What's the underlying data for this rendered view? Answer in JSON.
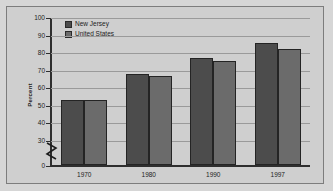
{
  "chart_data": {
    "type": "bar",
    "title": "",
    "xlabel": "",
    "ylabel": "Percent",
    "categories": [
      "1970",
      "1980",
      "1990",
      "1997"
    ],
    "series": [
      {
        "name": "New Jersey",
        "color": "#4c4c4c",
        "values": [
          52.5,
          67.5,
          76.5,
          85.0
        ]
      },
      {
        "name": "United States",
        "color": "#6b6b6b",
        "values": [
          52.5,
          66.5,
          75.0,
          82.0
        ]
      }
    ],
    "ylim": [
      0,
      100
    ],
    "yticks": [
      "0",
      "30",
      "40",
      "50",
      "60",
      "70",
      "80",
      "90",
      "100"
    ],
    "grid": true,
    "legend_position": "top-left",
    "axis_break": true,
    "axis_break_note": "y-axis broken between 0 and 30"
  },
  "legend": {
    "entries": [
      {
        "label": "New Jersey"
      },
      {
        "label": "United States"
      }
    ]
  },
  "axes": {
    "y_title": "Percent",
    "y_ticks": [
      {
        "label": "100",
        "value": 100
      },
      {
        "label": "90",
        "value": 90
      },
      {
        "label": "80",
        "value": 80
      },
      {
        "label": "70",
        "value": 70
      },
      {
        "label": "60",
        "value": 60
      },
      {
        "label": "50",
        "value": 50
      },
      {
        "label": "40",
        "value": 40
      },
      {
        "label": "30",
        "value": 30
      },
      {
        "label": "0",
        "value": 0
      }
    ],
    "x_categories": [
      "1970",
      "1980",
      "1990",
      "1997"
    ]
  },
  "colors": {
    "new_jersey": "#4c4c4c",
    "united_states": "#6b6b6b",
    "background": "#cfcfcf",
    "frame": "#7d7d7d",
    "grid": "#9a9a9a"
  }
}
